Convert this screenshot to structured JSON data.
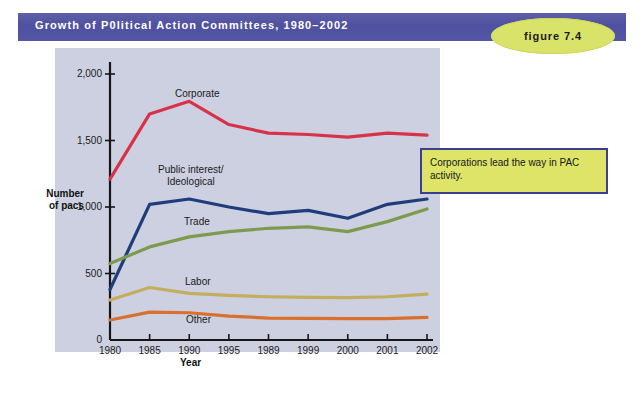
{
  "banner": {
    "title": "Growth of P0litical Action Committees, 1980–2002",
    "badge_label": "figure 7.4",
    "bar_color": "#5456a6",
    "badge_color": "#d9e36a"
  },
  "callout": {
    "text": "Corporations lead the way in PAC activity.",
    "fill": "#dde468",
    "border": "#3b3f8f"
  },
  "chart_data": {
    "type": "line",
    "title": "Growth of P0litical Action Committees, 1980–2002",
    "xlabel": "Year",
    "ylabel": "Number of pacs",
    "categories": [
      "1980",
      "1985",
      "1990",
      "1995",
      "1989",
      "1999",
      "2000",
      "2001",
      "2002"
    ],
    "ylim": [
      0,
      2000
    ],
    "yticks": [
      0,
      500,
      1000,
      1500,
      2000
    ],
    "ytick_labels": [
      "0",
      "500",
      "1,000",
      "1,500",
      "2,000"
    ],
    "grid": false,
    "legend": "inline-labels",
    "series": [
      {
        "name": "Corporate",
        "color": "#d8324a",
        "values": [
          1210,
          1700,
          1795,
          1620,
          1555,
          1545,
          1525,
          1555,
          1540
        ],
        "label_pos": {
          "x": 175,
          "y": 88
        }
      },
      {
        "name": "Public interest/\nIdeological",
        "color": "#1f3d7a",
        "values": [
          380,
          1020,
          1060,
          1000,
          950,
          975,
          915,
          1020,
          1060
        ],
        "label_pos": {
          "x": 158,
          "y": 164
        }
      },
      {
        "name": "Trade",
        "color": "#7d9b4e",
        "values": [
          575,
          700,
          775,
          815,
          840,
          850,
          815,
          890,
          985
        ],
        "label_pos": {
          "x": 184,
          "y": 216
        }
      },
      {
        "name": "Labor",
        "color": "#c2ae5e",
        "values": [
          300,
          395,
          350,
          335,
          325,
          320,
          318,
          325,
          345
        ],
        "label_pos": {
          "x": 185,
          "y": 276
        }
      },
      {
        "name": "Other",
        "color": "#d9702f",
        "values": [
          150,
          210,
          205,
          180,
          165,
          163,
          160,
          160,
          170
        ],
        "label_pos": {
          "x": 186,
          "y": 314
        }
      }
    ]
  }
}
